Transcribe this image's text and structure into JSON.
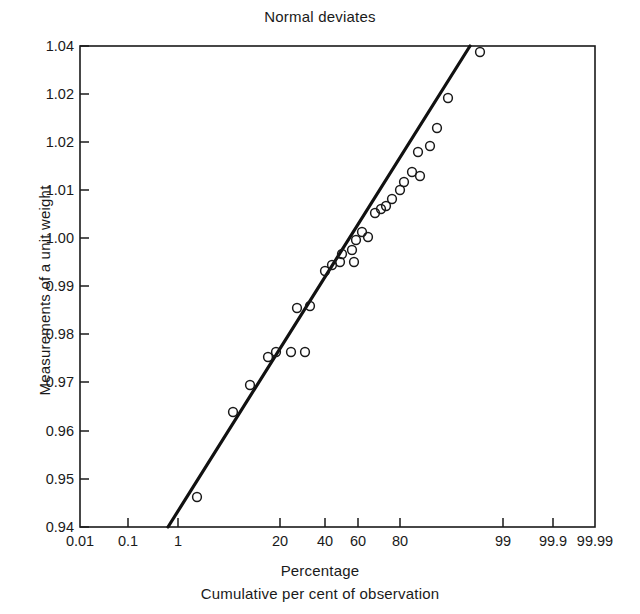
{
  "chart_data": {
    "type": "scatter",
    "title": "Normal deviates",
    "xlabel": "Percentage",
    "xlabel2": "Cumulative per cent of observation",
    "ylabel": "Measurements of a unit weight",
    "grid": false,
    "legend": "none",
    "x_axis": {
      "scale": "probability",
      "tick_labels": [
        "0.01",
        "0.1",
        "1",
        "20",
        "40",
        "60",
        "80",
        "99",
        "99.9",
        "99.99"
      ],
      "tick_positions_px": [
        80,
        128,
        178,
        280,
        325,
        358,
        400,
        503,
        553,
        595
      ],
      "range_px": [
        80,
        595
      ]
    },
    "y_axis": {
      "tick_labels": [
        "1.04",
        "1.02",
        "1.02",
        "1.01",
        "1.00",
        "0.99",
        "0.98",
        "0.97",
        "0.96",
        "0.95",
        "0.94"
      ],
      "tick_positions_px": [
        46,
        94,
        142,
        190,
        238,
        286,
        334,
        382,
        431,
        479,
        527
      ],
      "ylim": [
        0.94,
        1.04
      ],
      "range_px": [
        46,
        527
      ]
    },
    "points_px": [
      [
        197,
        497
      ],
      [
        233,
        412
      ],
      [
        250,
        385
      ],
      [
        268,
        357
      ],
      [
        276,
        352
      ],
      [
        291,
        352
      ],
      [
        305,
        352
      ],
      [
        297,
        308
      ],
      [
        310,
        306
      ],
      [
        325,
        271
      ],
      [
        332,
        265
      ],
      [
        340,
        262
      ],
      [
        342,
        254
      ],
      [
        352,
        250
      ],
      [
        356,
        240
      ],
      [
        362,
        232
      ],
      [
        368,
        237
      ],
      [
        354,
        262
      ],
      [
        375,
        213
      ],
      [
        381,
        209
      ],
      [
        386,
        206
      ],
      [
        392,
        199
      ],
      [
        400,
        190
      ],
      [
        404,
        182
      ],
      [
        412,
        172
      ],
      [
        420,
        176
      ],
      [
        418,
        152
      ],
      [
        430,
        146
      ],
      [
        437,
        128
      ],
      [
        448,
        98
      ],
      [
        480,
        52
      ]
    ],
    "fit_line_px": {
      "x1": 168,
      "y1": 527,
      "x2": 470,
      "y2": 46
    },
    "series": [
      {
        "name": "observations",
        "x_percent": [
          2.5,
          8.0,
          11.0,
          15.0,
          17.0,
          22.0,
          27.0,
          24.0,
          28.0,
          38.0,
          41.0,
          44.0,
          45.0,
          49.0,
          51.0,
          53.0,
          56.0,
          50.0,
          60.0,
          62.0,
          64.0,
          67.0,
          70.0,
          72.0,
          76.0,
          79.0,
          78.0,
          83.0,
          85.0,
          89.0,
          96.0
        ],
        "y_value": [
          0.9482,
          0.9658,
          0.9714,
          0.9772,
          0.9782,
          0.9782,
          0.9782,
          0.9873,
          0.9877,
          0.995,
          0.9962,
          0.9969,
          0.9985,
          0.9994,
          1.0014,
          1.0031,
          1.0021,
          0.9969,
          1.009,
          1.0098,
          1.0104,
          1.0119,
          1.0137,
          1.0154,
          1.0175,
          1.0166,
          1.0216,
          1.0229,
          1.0266,
          1.0329,
          1.0425
        ]
      }
    ]
  }
}
